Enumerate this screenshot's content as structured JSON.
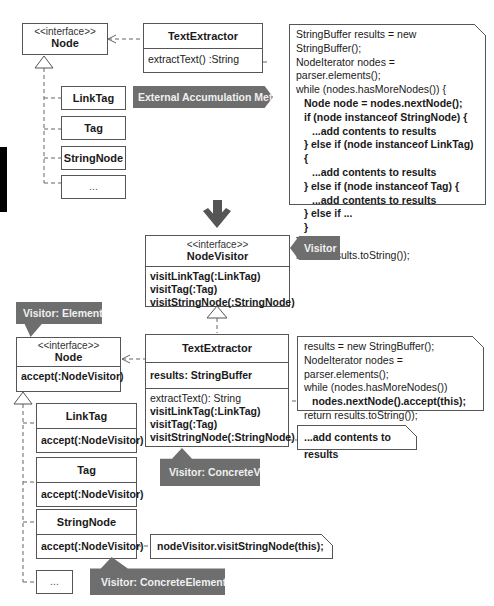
{
  "top": {
    "node_interface": {
      "stereotype": "<<interface>>",
      "name": "Node"
    },
    "text_extractor": {
      "name": "TextExtractor",
      "operation": "extractText() :String"
    },
    "subclasses": [
      "LinkTag",
      "Tag",
      "StringNode",
      "..."
    ],
    "banner": "External Accumulation Method",
    "code_note": [
      {
        "text": "StringBuffer results = new StringBuffer();",
        "bold": false,
        "indent": 0
      },
      {
        "text": "NodeIterator nodes = parser.elements();",
        "bold": false,
        "indent": 0
      },
      {
        "text": "while (nodes.hasMoreNodes()) {",
        "bold": false,
        "indent": 0
      },
      {
        "text": "Node node = nodes.nextNode();",
        "bold": true,
        "indent": 1
      },
      {
        "text": "if (node instanceof StringNode) {",
        "bold": true,
        "indent": 1
      },
      {
        "text": "...add contents to results",
        "bold": true,
        "indent": 2
      },
      {
        "text": "} else if (node instanceof LinkTag) {",
        "bold": true,
        "indent": 1
      },
      {
        "text": "...add contents to results",
        "bold": true,
        "indent": 2
      },
      {
        "text": "} else if (node instanceof Tag) {",
        "bold": true,
        "indent": 1
      },
      {
        "text": "...add contents to results",
        "bold": true,
        "indent": 2
      },
      {
        "text": "} else if ...",
        "bold": true,
        "indent": 1
      },
      {
        "text": "}",
        "bold": true,
        "indent": 1
      },
      {
        "text": "}",
        "bold": false,
        "indent": 0
      },
      {
        "text": "return results.toString());",
        "bold": false,
        "indent": 0
      }
    ]
  },
  "arrow": "down-arrow",
  "bottom": {
    "node_visitor": {
      "stereotype": "<<interface>>",
      "name": "NodeVisitor",
      "operations": [
        "visitLinkTag(:LinkTag)",
        "visitTag(:Tag)",
        "visitStringNode(:StringNode)"
      ]
    },
    "visitor_tag": "Visitor",
    "element_tag": "Visitor: Element",
    "node_interface": {
      "stereotype": "<<interface>>",
      "name": "Node",
      "operation": "accept(:NodeVisitor)"
    },
    "text_extractor": {
      "name": "TextExtractor",
      "attribute": "results: StringBuffer",
      "operations": [
        "extractText(): String",
        "visitLinkTag(:LinkTag)",
        "visitTag(:Tag)",
        "visitStringNode(:StringNode)"
      ]
    },
    "concrete_visitor_tag": "Visitor: ConcreteVisitor",
    "concrete_element_tag": "Visitor: ConcreteElement",
    "elements": [
      {
        "name": "LinkTag",
        "operation": "accept(:NodeVisitor)"
      },
      {
        "name": "Tag",
        "operation": "accept(:NodeVisitor)"
      },
      {
        "name": "StringNode",
        "operation": "accept(:NodeVisitor)"
      },
      {
        "name": "..."
      }
    ],
    "extract_note": [
      {
        "text": "results = new StringBuffer();",
        "bold": false,
        "indent": 0
      },
      {
        "text": "NodeIterator nodes = parser.elements();",
        "bold": false,
        "indent": 0
      },
      {
        "text": "while (nodes.hasMoreNodes())",
        "bold": false,
        "indent": 0
      },
      {
        "text": "nodes.nextNode().accept(this);",
        "bold": true,
        "indent": 1
      },
      {
        "text": "return results.toString());",
        "bold": false,
        "indent": 0
      }
    ],
    "visit_note": "...add contents to results",
    "accept_note": "nodeVisitor.visitStringNode(this);"
  }
}
